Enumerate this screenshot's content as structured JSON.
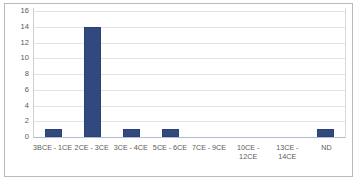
{
  "chart_data": {
    "type": "bar",
    "title": "",
    "subtitle": "",
    "xlabel": "",
    "ylabel": "",
    "categories": [
      "3BCE - 1CE",
      "2CE - 3CE",
      "3CE - 4CE",
      "5CE - 6CE",
      "7CE - 9CE",
      "10CE - 12CE",
      "13CE - 14CE",
      "ND"
    ],
    "values": [
      1,
      14,
      1,
      1,
      0,
      0,
      0,
      1
    ],
    "ylim": [
      0,
      16
    ],
    "yticks": [
      0,
      2,
      4,
      6,
      8,
      10,
      12,
      14,
      16
    ],
    "ytick_labels": [
      "0",
      "2",
      "4",
      "6",
      "8",
      "10",
      "12",
      "14",
      "16"
    ],
    "grid": true,
    "grid_axis": "y",
    "legend": false,
    "legend_position": "none",
    "bar_color": "#31497f",
    "grid_color": "#e3e3e3",
    "axis_label_color": "#5a5a5a",
    "frame_color": "#b9b9b9",
    "background": "#ffffff"
  }
}
